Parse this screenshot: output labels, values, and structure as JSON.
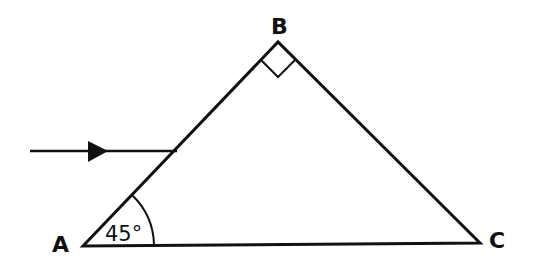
{
  "diagram": {
    "type": "geometry-triangle",
    "stroke_color": "#111111",
    "background": "#ffffff",
    "vertices": {
      "A": {
        "label": "A",
        "x": 83,
        "y": 246
      },
      "B": {
        "label": "B",
        "x": 278,
        "y": 42
      },
      "C": {
        "label": "C",
        "x": 480,
        "y": 243
      }
    },
    "angles": {
      "A": {
        "value_label": "45°",
        "marker": "arc"
      },
      "B": {
        "value_label": "",
        "marker": "right-angle-square"
      }
    },
    "incident_ray": {
      "direction": "left-to-right",
      "start": {
        "x": 30,
        "y": 151
      },
      "end": {
        "x": 177,
        "y": 151
      },
      "has_arrowhead": true
    }
  }
}
